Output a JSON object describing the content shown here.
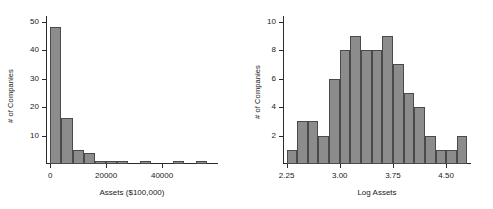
{
  "figure": {
    "panels": [
      "assets-histogram",
      "log-assets-histogram"
    ]
  },
  "chart_data": [
    {
      "type": "bar",
      "name": "assets-histogram",
      "title": "",
      "xlabel": "Assets ($100,000)",
      "ylabel": "# of Companies",
      "xlim": [
        -1500,
        60000
      ],
      "ylim": [
        0,
        52
      ],
      "xticks": [
        0,
        20000,
        40000
      ],
      "xticklabels": [
        "0",
        "20000",
        "40000"
      ],
      "yticks": [
        10,
        20,
        30,
        40,
        50
      ],
      "yticklabels": [
        "10",
        "20",
        "30",
        "40",
        "50"
      ],
      "grid": false,
      "legend": "none",
      "bin_width": 4000,
      "bin_starts": [
        0,
        4000,
        8000,
        12000,
        16000,
        20000,
        24000,
        28000,
        32000,
        36000,
        40000,
        44000,
        48000,
        52000,
        56000
      ],
      "values": [
        48,
        16,
        5,
        4,
        1,
        1,
        1,
        0,
        1,
        0,
        0,
        1,
        0,
        1,
        0
      ]
    },
    {
      "type": "bar",
      "name": "log-assets-histogram",
      "title": "",
      "xlabel": "Log Assets",
      "ylabel": "# of Companies",
      "xlim": [
        2.2,
        4.85
      ],
      "ylim": [
        0,
        10.4
      ],
      "xticks": [
        2.25,
        3.0,
        3.75,
        4.5
      ],
      "xticklabels": [
        "2.25",
        "3.00",
        "3.75",
        "4.50"
      ],
      "yticks": [
        2,
        4,
        6,
        8,
        10
      ],
      "yticklabels": [
        "2",
        "4",
        "6",
        "8",
        "10"
      ],
      "grid": false,
      "legend": "none",
      "bin_width": 0.15,
      "bin_starts": [
        2.25,
        2.4,
        2.55,
        2.7,
        2.85,
        3.0,
        3.15,
        3.3,
        3.45,
        3.6,
        3.75,
        3.9,
        4.05,
        4.2,
        4.35,
        4.5,
        4.65
      ],
      "values": [
        1,
        3,
        3,
        2,
        6,
        8,
        9,
        8,
        8,
        9,
        7,
        5,
        4,
        2,
        1,
        1,
        2
      ]
    }
  ],
  "style": {
    "bar_fill": "#8c8c8c",
    "bar_stroke": "#4a4a4a",
    "axis_color": "#2b2b2b",
    "text_color": "#1a1a1a",
    "background": "#ffffff"
  }
}
